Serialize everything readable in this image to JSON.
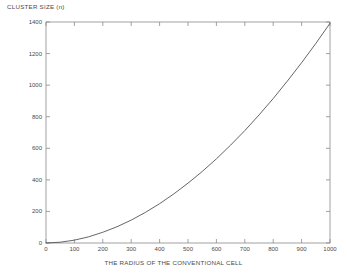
{
  "chart_data": {
    "type": "line",
    "title": "",
    "ylabel": "CLUSTER SIZE (n)",
    "xlabel": "THE RADIUS OF THE CONVENTIONAL CELL",
    "xlim": [
      0,
      1000
    ],
    "ylim": [
      0,
      1400
    ],
    "xticks": [
      0,
      100,
      200,
      300,
      400,
      500,
      600,
      700,
      800,
      900,
      1000
    ],
    "yticks": [
      0,
      200,
      400,
      600,
      800,
      1000,
      1200,
      1400
    ],
    "grid": false,
    "legend": null,
    "box": true,
    "series": [
      {
        "name": "cluster size vs radius",
        "color": "#555555",
        "x": [
          0,
          50,
          100,
          150,
          200,
          250,
          300,
          350,
          400,
          450,
          500,
          550,
          600,
          650,
          700,
          750,
          800,
          850,
          900,
          950,
          1000
        ],
        "values": [
          0,
          5,
          18,
          39,
          68,
          103,
          145,
          194,
          249,
          311,
          379,
          453,
          533,
          620,
          712,
          811,
          915,
          1026,
          1142,
          1264,
          1392
        ]
      }
    ]
  },
  "figure": {
    "background_color": "#ffffff",
    "axis_color": "#8a8a8a",
    "text_color": "#4a4a4a",
    "curve_color": "#555555"
  }
}
